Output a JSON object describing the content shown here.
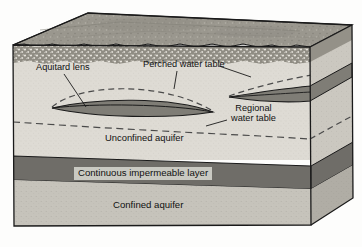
{
  "figure": {
    "labels": {
      "aquitard_lens": "Aquitard lens",
      "perched_water_table": "Perched water table",
      "regional_water_table_line1": "Regional",
      "regional_water_table_line2": "water table",
      "unconfined_aquifer": "Unconfined aquifer",
      "continuous_impermeable_layer": "Continuous impermeable layer",
      "confined_aquifer": "Confined aquifer"
    },
    "colors": {
      "top_surface": "#9a978e",
      "soil_horizon": "#8c8980",
      "unconfined_aquifer": "#dedbd4",
      "impermeable_layer": "#6f6d68",
      "confined_aquifer": "#c6c3bb",
      "aquitard_lens": "#7f7d76",
      "right_face_shade": "#a3a099",
      "outline": "#1a1a1a",
      "dashed_water_table": "#4a4a4a",
      "label_box": "#c9c9c2",
      "background": "#fdfdfc"
    },
    "elements": {
      "top_surface_name": "ground-surface",
      "soil_band_name": "soil-horizon-band",
      "left_lens_name": "aquitard-lens-left",
      "right_lens_name": "aquitard-lens-right",
      "perched_arc_left_name": "perched-water-table-arc-left",
      "perched_arc_right_name": "perched-water-table-arc-right",
      "regional_line_name": "regional-water-table-line"
    }
  }
}
